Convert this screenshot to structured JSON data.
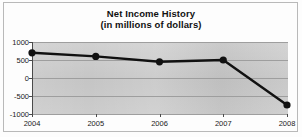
{
  "chart_data": {
    "type": "line",
    "title": "Net Income History",
    "subtitle": "(in millions of dollars)",
    "xlabel": "",
    "ylabel": "",
    "categories": [
      "2004",
      "2005",
      "2006",
      "2007",
      "2008"
    ],
    "values": [
      700,
      600,
      450,
      500,
      -750
    ],
    "ylim": [
      -1000,
      1000
    ],
    "ytick_labels": [
      "1000",
      "500",
      "0",
      "-500",
      "-1000"
    ],
    "ytick_values": [
      1000,
      500,
      0,
      -500,
      -1000
    ],
    "grid": true,
    "legend": false,
    "marker": "filled-circle",
    "line_color": "#111111",
    "marker_color": "#111111",
    "plot_background": "#c9c9c9",
    "gridline_color": "#9e9e9e",
    "axis_color": "#4a4a4a"
  },
  "figure": {
    "title_main": "Net Income History",
    "title_sub": "(in millions of dollars)"
  }
}
